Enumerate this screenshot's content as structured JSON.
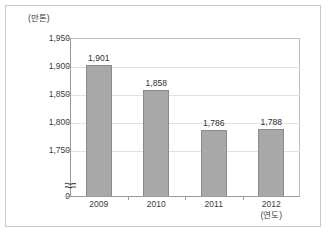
{
  "chart_data": {
    "type": "bar",
    "title": "",
    "subtitle": "",
    "unit_label": "(만톤)",
    "xlabel": "(연도)",
    "ylabel": "",
    "categories": [
      "2009",
      "2010",
      "2011",
      "2012"
    ],
    "values": [
      1901,
      1858,
      1786,
      1788
    ],
    "value_labels": [
      "1,901",
      "1,858",
      "1,786",
      "1,788"
    ],
    "ytick_labels": [
      "1,950",
      "1,900",
      "1,850",
      "1,800",
      "1,750",
      "0"
    ],
    "ytick_values": [
      1950,
      1900,
      1850,
      1800,
      1750,
      0
    ],
    "ylim": [
      1750,
      1950
    ],
    "axis_break": true,
    "axis_break_symbol": "≈",
    "grid": true,
    "grid_axis": "y",
    "legend": false,
    "legend_position": "none",
    "series": [
      {
        "name": "생산량",
        "values": [
          1901,
          1858,
          1786,
          1788
        ]
      }
    ]
  },
  "style": {
    "bar_fill": "#a8a8a8",
    "bar_border": "#8a8a8a",
    "grid_color": "#e2e2e2",
    "axis_color": "#9a9a9a",
    "frame_color": "#c9c9c9",
    "text_color": "#3c3c3c",
    "background": "#ffffff"
  }
}
